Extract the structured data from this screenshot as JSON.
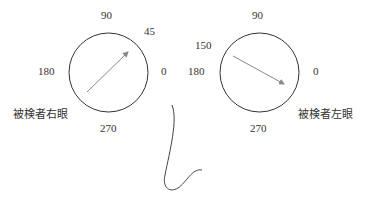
{
  "right_eye": {
    "caption": "被検者右眼",
    "ticks": {
      "top": "90",
      "left": "180",
      "right": "0",
      "bottom": "270",
      "axis": "45"
    },
    "axis_angle_deg": 45
  },
  "left_eye": {
    "caption": "被検者左眼",
    "ticks": {
      "top": "90",
      "left": "180",
      "right": "0",
      "bottom": "270",
      "axis": "150"
    },
    "axis_angle_deg": 150
  },
  "colors": {
    "line": "#333333",
    "arrow": "#888888"
  }
}
